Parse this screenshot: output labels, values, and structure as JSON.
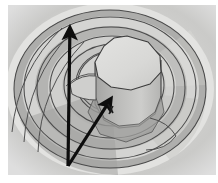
{
  "figure": {
    "alt_text": "Shaded grayscale diagram showing nested concentric rings forming a bowl or crater-like surface, with a faceted cylindrical column rising at the centre. Two black annotation arrows originate from a common point near the lower left: one points vertically upward, the other points diagonally up and to the right toward the base of the central cylinder.",
    "background_color": "#ffffff",
    "canvas": {
      "width": 218,
      "height": 183
    },
    "plot_area": {
      "x": 8,
      "y": 5,
      "width": 208,
      "height": 170
    },
    "icon_names": [
      "up-arrow-annotation-icon",
      "diagonal-arrow-annotation-icon",
      "contour-ring-icon",
      "cylinder-icon"
    ],
    "palette": {
      "paper_white": "#ffffff",
      "field_light": "#e9e9e7",
      "field_pale": "#dedede",
      "field_mid_light": "#d2d2d0",
      "field_mid": "#c2c2c0",
      "field_mid_dark": "#b2b2b0",
      "field_dark": "#9d9d9b",
      "field_darkest": "#8d8d8b",
      "cylinder_top": "#dcdcda",
      "cylinder_side_light": "#c8c8c6",
      "cylinder_side_dark": "#a9a9a7",
      "contour_line": "#4a4a4a",
      "outline_line": "#3c3c3c",
      "annotation_black": "#0d0d0d",
      "marker_black": "#1a1a1a"
    },
    "bands": [
      {
        "name": "outer-rim-band",
        "tone": "#e4e4e2",
        "order": 1
      },
      {
        "name": "upper-shadow-band",
        "tone": "#a6a6a4",
        "order": 2
      },
      {
        "name": "mid-highlight-band",
        "tone": "#d6d6d4",
        "order": 3
      },
      {
        "name": "inner-shadow-band",
        "tone": "#b0b0ae",
        "order": 4
      },
      {
        "name": "basin-floor-band",
        "tone": "#cfcfcd",
        "order": 5
      },
      {
        "name": "cylinder-shadow",
        "tone": "#9e9e9c",
        "order": 6
      }
    ],
    "annotations": [
      {
        "name": "vertical-arrow",
        "kind": "arrow",
        "from": {
          "x": 68,
          "y": 166
        },
        "to": {
          "x": 70,
          "y": 22
        },
        "color": "#0d0d0d",
        "stroke_width": 3.2,
        "head": "solid-triangle",
        "label": ""
      },
      {
        "name": "diagonal-arrow",
        "kind": "arrow",
        "from": {
          "x": 68,
          "y": 166
        },
        "to": {
          "x": 114,
          "y": 94
        },
        "color": "#0d0d0d",
        "stroke_width": 3.2,
        "head": "solid-triangle",
        "label": ""
      },
      {
        "name": "center-marker",
        "kind": "point-mark",
        "at": {
          "x": 111,
          "y": 110
        },
        "color": "#1a1a1a",
        "label": ""
      }
    ],
    "geometry": {
      "center": {
        "x": 112,
        "y": 88
      },
      "cylinder": {
        "name": "central-cylinder",
        "top_face_center": {
          "x": 127,
          "y": 68
        },
        "top_face_rx": 34,
        "top_face_ry": 28,
        "facets": 10,
        "body_height": 44
      },
      "rings": [
        {
          "name": "ring-1-outermost",
          "rx": 104,
          "ry": 86,
          "cx": 110,
          "cy": 89
        },
        {
          "name": "ring-2",
          "rx": 96,
          "ry": 79,
          "cx": 110,
          "cy": 89
        },
        {
          "name": "ring-3",
          "rx": 86,
          "ry": 71,
          "cx": 110,
          "cy": 88
        },
        {
          "name": "ring-4",
          "rx": 74,
          "ry": 61,
          "cx": 111,
          "cy": 88
        },
        {
          "name": "ring-5",
          "rx": 62,
          "ry": 51,
          "cx": 112,
          "cy": 87
        },
        {
          "name": "ring-6",
          "rx": 50,
          "ry": 41,
          "cx": 114,
          "cy": 85
        },
        {
          "name": "ring-7-innermost",
          "rx": 38,
          "ry": 31,
          "cx": 116,
          "cy": 82
        }
      ]
    }
  },
  "chart_data": {
    "type": "heatmap",
    "title": "",
    "xlabel": "",
    "ylabel": "",
    "grid": false,
    "legend": "none",
    "contour_levels": [
      1,
      2,
      3,
      4,
      5,
      6,
      7
    ],
    "level_tones": [
      "#e4e4e2",
      "#d9d9d7",
      "#cfcfcd",
      "#c2c2c0",
      "#b2b2b0",
      "#a6a6a4",
      "#9a9a98"
    ],
    "vectors": [
      {
        "name": "vertical-arrow",
        "x0": 68,
        "y0": 166,
        "x1": 70,
        "y1": 22
      },
      {
        "name": "diagonal-arrow",
        "x0": 68,
        "y0": 166,
        "x1": 114,
        "y1": 94
      }
    ]
  }
}
